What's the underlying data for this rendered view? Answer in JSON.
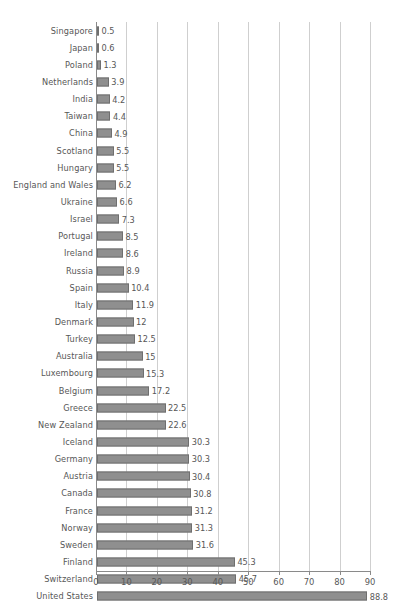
{
  "chart_data": {
    "type": "bar",
    "orientation": "horizontal",
    "title": "",
    "subtitle": "",
    "xlabel": "",
    "ylabel": "",
    "xlim": [
      0,
      90
    ],
    "xticks": [
      0,
      10,
      20,
      30,
      40,
      50,
      60,
      70,
      80,
      90
    ],
    "grid": "vertical",
    "legend": "none",
    "bar_color": "#8f8f8f",
    "bar_border_color": "#6f6f6f",
    "gridline_color": "#cfcfcf",
    "axis_color": "#8a8a8a",
    "text_color": "#575757",
    "categories": [
      "Singapore",
      "Japan",
      "Poland",
      "Netherlands",
      "India",
      "Taiwan",
      "China",
      "Scotland",
      "Hungary",
      "England and Wales",
      "Ukraine",
      "Israel",
      "Portugal",
      "Ireland",
      "Russia",
      "Spain",
      "Italy",
      "Denmark",
      "Turkey",
      "Australia",
      "Luxembourg",
      "Belgium",
      "Greece",
      "New Zealand",
      "Iceland",
      "Germany",
      "Austria",
      "Canada",
      "France",
      "Norway",
      "Sweden",
      "Finland",
      "Switzerland",
      "United States"
    ],
    "values": [
      0.5,
      0.6,
      1.3,
      3.9,
      4.2,
      4.4,
      4.9,
      5.5,
      5.5,
      6.2,
      6.6,
      7.3,
      8.5,
      8.6,
      8.9,
      10.4,
      11.9,
      12,
      12.5,
      15,
      15.3,
      17.2,
      22.5,
      22.6,
      30.3,
      30.3,
      30.4,
      30.8,
      31.2,
      31.3,
      31.6,
      45.3,
      45.7,
      88.8
    ],
    "value_labels": [
      "0.5",
      "0.6",
      "1.3",
      "3.9",
      "4.2",
      "4.4",
      "4.9",
      "5.5",
      "5.5",
      "6.2",
      "6.6",
      "7.3",
      "8.5",
      "8.6",
      "8.9",
      "10.4",
      "11.9",
      "12",
      "12.5",
      "15",
      "15.3",
      "17.2",
      "22.5",
      "22.6",
      "30.3",
      "30.3",
      "30.4",
      "30.8",
      "31.2",
      "31.3",
      "31.6",
      "45.3",
      "45.7",
      "88.8"
    ],
    "xtick_labels": [
      "0",
      "10",
      "20",
      "30",
      "40",
      "50",
      "60",
      "70",
      "80",
      "90"
    ]
  }
}
